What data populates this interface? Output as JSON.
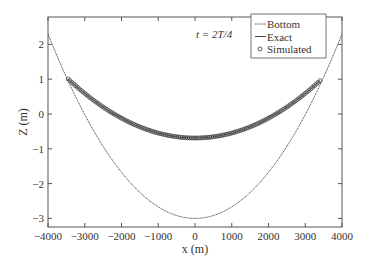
{
  "chart_data": {
    "type": "line",
    "title": "",
    "annotation": "t = 2T/4",
    "xlabel": "x (m)",
    "ylabel": "Z (m)",
    "xlim": [
      -4000,
      4000
    ],
    "ylim": [
      -3.2,
      2.6
    ],
    "xticks": [
      -4000,
      -3000,
      -2000,
      -1000,
      0,
      1000,
      2000,
      3000,
      4000
    ],
    "xtick_labels": [
      "−4000",
      "−3000",
      "−2000",
      "−1000",
      "0",
      "1000",
      "2000",
      "3000",
      "4000"
    ],
    "yticks": [
      -3,
      -2,
      -1,
      0,
      1,
      2
    ],
    "ytick_labels": [
      "−3",
      "−2",
      "−1",
      "0",
      "1",
      "2"
    ],
    "grid": false,
    "legend_position": "upper right",
    "series": [
      {
        "name": "Bottom",
        "style": "dotted line",
        "formula": "z = -3 + 5.3*(x/4000)^2",
        "x": [
          -4000,
          -3000,
          -2000,
          -1000,
          0,
          1000,
          2000,
          3000,
          4000
        ],
        "values": [
          2.3,
          -0.02,
          -1.68,
          -2.67,
          -3.0,
          -2.67,
          -1.68,
          -0.02,
          2.3
        ]
      },
      {
        "name": "Exact",
        "style": "solid line",
        "x": [
          -3450,
          -3000,
          -2000,
          -1000,
          0,
          1000,
          2000,
          3000,
          3400
        ],
        "values": [
          0.98,
          0.62,
          0.04,
          -0.54,
          -0.69,
          -0.54,
          0.04,
          0.62,
          0.98
        ]
      },
      {
        "name": "Simulated",
        "style": "circle markers",
        "x_range": [
          -3450,
          3400
        ],
        "note": "dense circles overlapping the exact solution",
        "z_min": -0.69,
        "z_ends": 0.98
      }
    ]
  },
  "legend": {
    "items": [
      {
        "label": "Bottom"
      },
      {
        "label": "Exact"
      },
      {
        "label": "Simulated"
      }
    ]
  },
  "colors": {
    "axis": "#555555",
    "line": "#444444",
    "marker": "#333333"
  }
}
